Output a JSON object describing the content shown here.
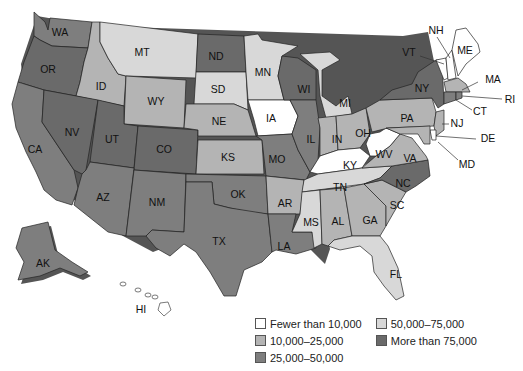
{
  "title": "",
  "colors": {
    "c0": "#ffffff",
    "c1": "#b4b4b4",
    "c2": "#7e7e7e",
    "c3": "#d8d8d8",
    "c4": "#6a6a6a",
    "shadow": "#555555"
  },
  "legend": {
    "items": [
      {
        "key": "c0",
        "label": "Fewer than 10,000"
      },
      {
        "key": "c1",
        "label": "10,000–25,000"
      },
      {
        "key": "c2",
        "label": "25,000–50,000"
      },
      {
        "key": "c3",
        "label": "50,000–75,000"
      },
      {
        "key": "c4",
        "label": "More than 75,000"
      }
    ]
  },
  "states": {
    "WA": {
      "label": "WA",
      "class": "25,000–50,000"
    },
    "OR": {
      "label": "OR",
      "class": "More than 75,000"
    },
    "CA": {
      "label": "CA",
      "class": "25,000–50,000"
    },
    "ID": {
      "label": "ID",
      "class": "10,000–25,000"
    },
    "NV": {
      "label": "NV",
      "class": "More than 75,000"
    },
    "MT": {
      "label": "MT",
      "class": "50,000–75,000"
    },
    "WY": {
      "label": "WY",
      "class": "10,000–25,000"
    },
    "UT": {
      "label": "UT",
      "class": "More than 75,000"
    },
    "CO": {
      "label": "CO",
      "class": "More than 75,000"
    },
    "AZ": {
      "label": "AZ",
      "class": "25,000–50,000"
    },
    "NM": {
      "label": "NM",
      "class": "25,000–50,000"
    },
    "ND": {
      "label": "ND",
      "class": "More than 75,000"
    },
    "SD": {
      "label": "SD",
      "class": "50,000–75,000"
    },
    "NE": {
      "label": "NE",
      "class": "10,000–25,000"
    },
    "KS": {
      "label": "KS",
      "class": "10,000–25,000"
    },
    "OK": {
      "label": "OK",
      "class": "25,000–50,000"
    },
    "TX": {
      "label": "TX",
      "class": "25,000–50,000"
    },
    "MN": {
      "label": "MN",
      "class": "50,000–75,000"
    },
    "IA": {
      "label": "IA",
      "class": "Fewer than 10,000"
    },
    "MO": {
      "label": "MO",
      "class": "25,000–50,000"
    },
    "AR": {
      "label": "AR",
      "class": "10,000–25,000"
    },
    "LA": {
      "label": "LA",
      "class": "25,000–50,000"
    },
    "WI": {
      "label": "WI",
      "class": "More than 75,000"
    },
    "IL": {
      "label": "IL",
      "class": "25,000–50,000"
    },
    "MI": {
      "label": "MI",
      "class": "50,000–75,000"
    },
    "IN": {
      "label": "IN",
      "class": "10,000–25,000"
    },
    "OH": {
      "label": "OH",
      "class": "10,000–25,000"
    },
    "KY": {
      "label": "KY",
      "class": "Fewer than 10,000"
    },
    "TN": {
      "label": "TN",
      "class": "50,000–75,000"
    },
    "MS": {
      "label": "MS",
      "class": "50,000–75,000"
    },
    "AL": {
      "label": "AL",
      "class": "10,000–25,000"
    },
    "GA": {
      "label": "GA",
      "class": "10,000–25,000"
    },
    "FL": {
      "label": "FL",
      "class": "50,000–75,000"
    },
    "SC": {
      "label": "SC",
      "class": "10,000–25,000"
    },
    "NC": {
      "label": "NC",
      "class": "More than 75,000"
    },
    "VA": {
      "label": "VA",
      "class": "10,000–25,000"
    },
    "WV": {
      "label": "WV",
      "class": "Fewer than 10,000"
    },
    "PA": {
      "label": "PA",
      "class": "10,000–25,000"
    },
    "NY": {
      "label": "NY",
      "class": "More than 75,000"
    },
    "VT": {
      "label": "VT",
      "class": "Fewer than 10,000"
    },
    "NH": {
      "label": "NH",
      "class": "Fewer than 10,000"
    },
    "ME": {
      "label": "ME",
      "class": "Fewer than 10,000"
    },
    "MA": {
      "label": "MA",
      "class": "10,000–25,000"
    },
    "RI": {
      "label": "RI",
      "class": "25,000–50,000"
    },
    "CT": {
      "label": "CT",
      "class": "25,000–50,000"
    },
    "NJ": {
      "label": "NJ",
      "class": "10,000–25,000"
    },
    "DE": {
      "label": "DE",
      "class": "Fewer than 10,000"
    },
    "MD": {
      "label": "MD",
      "class": "10,000–25,000"
    },
    "AK": {
      "label": "AK",
      "class": "25,000–50,000"
    },
    "HI": {
      "label": "HI",
      "class": "Fewer than 10,000"
    }
  }
}
